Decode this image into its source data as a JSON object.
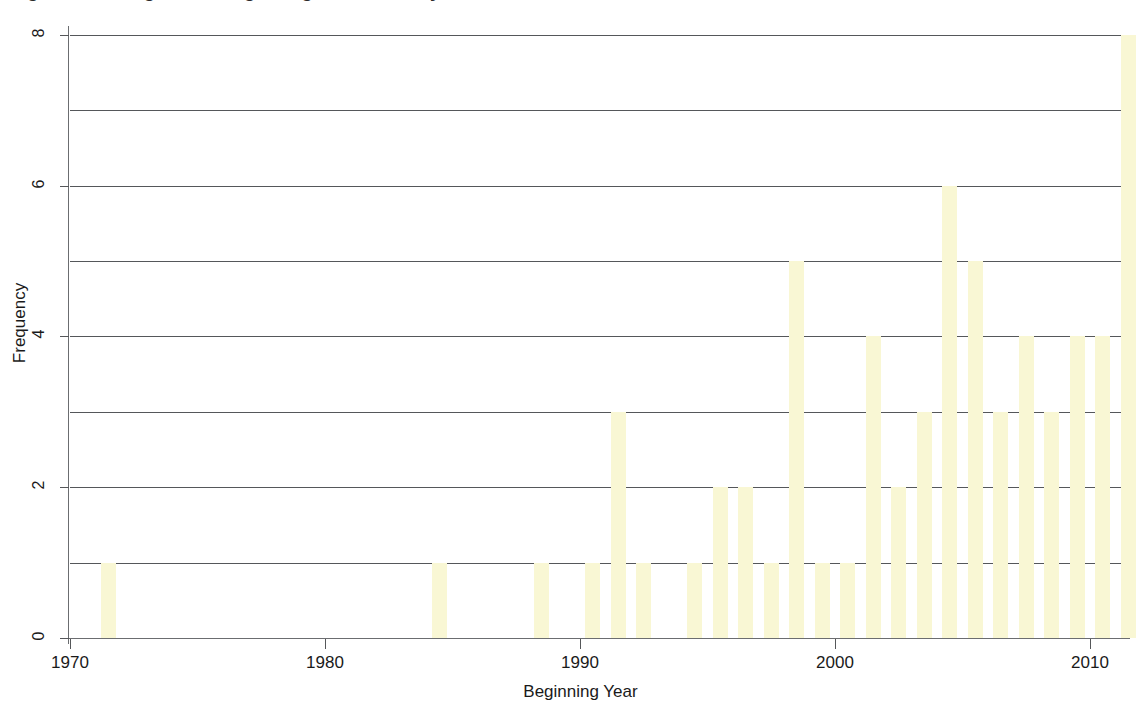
{
  "figure": {
    "title_cutoff": "Figure 3. Histogram of Beginning Year of Study",
    "background_color": "#ffffff",
    "bar_color": "#f9f7d4",
    "axis_color": "#55575a"
  },
  "axes": {
    "ylabel": "Frequency",
    "xlabel": "Beginning Year",
    "ytick_labels": [
      "0",
      "2",
      "4",
      "6",
      "8"
    ],
    "ytick_values": [
      0,
      2,
      4,
      6,
      8
    ],
    "xtick_labels": [
      "1970",
      "1980",
      "1990",
      "2000",
      "2010"
    ],
    "xtick_values": [
      1970,
      1980,
      1990,
      2000,
      2010
    ],
    "gridline_values": [
      1,
      2,
      3,
      4,
      5,
      6,
      7,
      8
    ]
  },
  "chart_data": {
    "type": "bar",
    "title": "Figure 3. Histogram of Beginning Year of Study",
    "xlabel": "Beginning Year",
    "ylabel": "Frequency",
    "xlim": [
      1970,
      2012
    ],
    "ylim": [
      0,
      8
    ],
    "grid": true,
    "legend": "none",
    "categories": [
      1971,
      1984,
      1988,
      1990,
      1991,
      1992,
      1994,
      1995,
      1996,
      1997,
      1998,
      1999,
      2000,
      2001,
      2002,
      2003,
      2004,
      2005,
      2006,
      2007,
      2008,
      2009,
      2010,
      2011
    ],
    "values": [
      1,
      1,
      1,
      1,
      3,
      1,
      1,
      2,
      2,
      1,
      5,
      1,
      1,
      4,
      2,
      3,
      6,
      5,
      3,
      4,
      3,
      4,
      4,
      8
    ]
  }
}
